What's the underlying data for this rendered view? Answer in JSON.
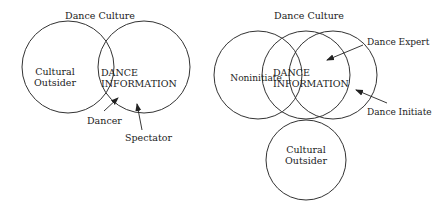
{
  "left_diagram": {
    "title": "Dance Culture",
    "outsider_line1": "Cultural",
    "outsider_line2": "Outsider",
    "info_line1": "DANCE",
    "info_line2": "INFORMATION",
    "dancer_label": "Dancer",
    "spectator_label": "Spectator"
  },
  "right_diagram": {
    "title": "Dance Culture",
    "noninitiate_label": "Noninitiate",
    "info_line1": "DANCE",
    "info_line2": "INFORMATION",
    "expert_label": "Dance Expert",
    "initiate_label": "Dance Initiate",
    "outsider_line1": "Cultural",
    "outsider_line2": "Outsider"
  },
  "colors": {
    "stroke": "#333333",
    "text": "#222222",
    "background": "#ffffff"
  }
}
